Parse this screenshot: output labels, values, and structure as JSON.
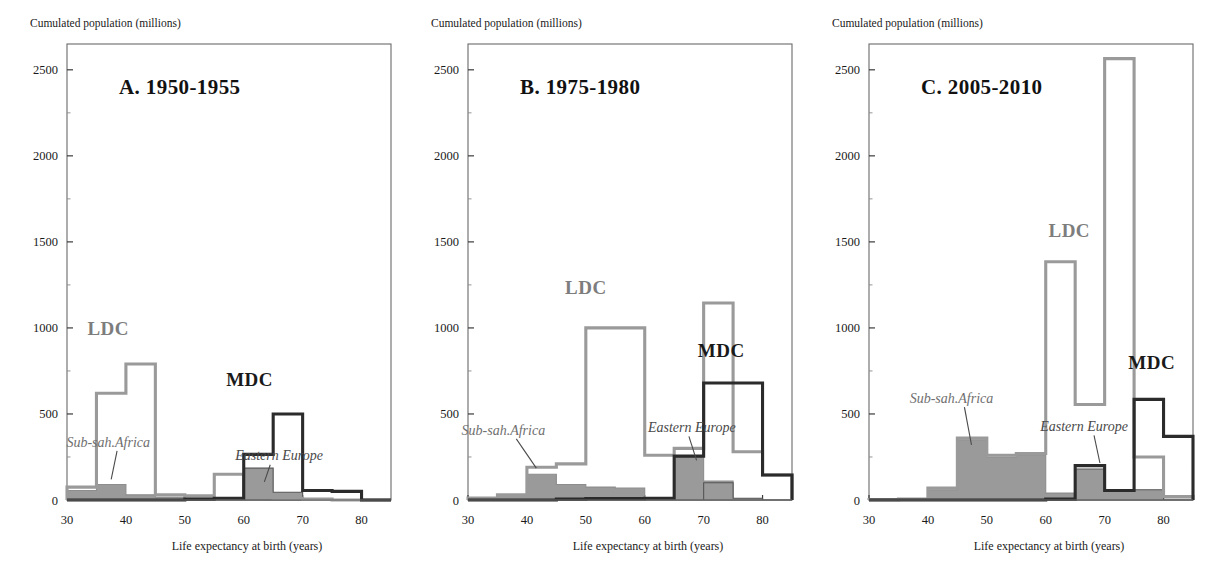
{
  "figure": {
    "background": "#ffffff",
    "colors": {
      "ldc_stroke": "#9a9a9a",
      "mdc_stroke": "#2b2b2b",
      "fill_grey": "#9a9a9a",
      "frame": "#6a6a6a",
      "text": "#1a1a1a"
    },
    "axis": {
      "ylabel": "Cumulated population (millions)",
      "xlabel": "Life expectancy at birth (years)",
      "yticks": [
        0,
        500,
        1000,
        1500,
        2000,
        2500
      ],
      "ytick_labels": [
        "0",
        "500",
        "1000",
        "1500",
        "2000",
        "2500"
      ],
      "xticks": [
        30,
        40,
        50,
        60,
        70,
        80
      ],
      "xtick_labels": [
        "30",
        "40",
        "50",
        "60",
        "70",
        "80"
      ],
      "ylim": [
        0,
        2650
      ],
      "xlim": [
        30,
        85
      ],
      "grid": false
    },
    "series_labels": {
      "ldc": "LDC",
      "mdc": "MDC",
      "sub_saharan_africa": "Sub-sah.Africa",
      "eastern_europe": "Eastern Europe"
    }
  },
  "chart_data": [
    {
      "id": "panel-a",
      "type": "bar",
      "title": "A. 1950-1955",
      "xlabel": "Life expectancy at birth (years)",
      "ylabel": "Cumulated population (millions)",
      "xlim": [
        30,
        85
      ],
      "ylim": [
        0,
        2650
      ],
      "bin_edges": [
        30,
        35,
        40,
        45,
        50,
        55,
        60,
        65,
        70,
        75,
        80,
        85
      ],
      "series": [
        {
          "name": "LDC",
          "style": "step-outline-grey",
          "values": [
            75,
            620,
            790,
            30,
            25,
            150,
            20,
            10,
            5,
            0,
            0
          ]
        },
        {
          "name": "MDC",
          "style": "step-outline-black",
          "values": [
            0,
            0,
            0,
            0,
            5,
            10,
            265,
            500,
            55,
            50,
            0
          ]
        },
        {
          "name": "Sub-sah.Africa",
          "style": "filled-grey",
          "values": [
            55,
            90,
            30,
            15,
            12,
            10,
            8,
            5,
            0,
            0,
            0
          ]
        },
        {
          "name": "Eastern Europe",
          "style": "filled-grey",
          "values": [
            0,
            0,
            0,
            0,
            0,
            0,
            185,
            45,
            0,
            0,
            0
          ]
        }
      ],
      "annotations": [
        {
          "text": "LDC",
          "x": 37,
          "y": 960
        },
        {
          "text": "MDC",
          "x": 61,
          "y": 660
        },
        {
          "text": "Sub-sah.Africa",
          "x": 37,
          "y": 310
        },
        {
          "text": "Eastern Europe",
          "x": 66,
          "y": 230
        }
      ]
    },
    {
      "id": "panel-b",
      "type": "bar",
      "title": "B. 1975-1980",
      "xlabel": "Life expectancy at birth (years)",
      "ylabel": "Cumulated population (millions)",
      "xlim": [
        30,
        85
      ],
      "ylim": [
        0,
        2650
      ],
      "bin_edges": [
        30,
        35,
        40,
        45,
        50,
        55,
        60,
        65,
        70,
        75,
        80,
        85
      ],
      "series": [
        {
          "name": "LDC",
          "style": "step-outline-grey",
          "values": [
            12,
            30,
            190,
            210,
            1000,
            1000,
            260,
            300,
            1145,
            280,
            145
          ]
        },
        {
          "name": "MDC",
          "style": "step-outline-black",
          "values": [
            0,
            0,
            0,
            5,
            8,
            8,
            10,
            255,
            680,
            680,
            145
          ]
        },
        {
          "name": "Sub-sah.Africa",
          "style": "filled-grey",
          "values": [
            10,
            30,
            150,
            90,
            75,
            70,
            10,
            250,
            110,
            5,
            0
          ]
        },
        {
          "name": "Eastern Europe",
          "style": "filled-grey",
          "values": [
            0,
            0,
            0,
            0,
            0,
            0,
            0,
            0,
            100,
            10,
            0
          ]
        }
      ],
      "annotations": [
        {
          "text": "LDC",
          "x": 50,
          "y": 1200
        },
        {
          "text": "MDC",
          "x": 73,
          "y": 830
        },
        {
          "text": "Sub-sah.Africa",
          "x": 36,
          "y": 380
        },
        {
          "text": "Eastern Europe",
          "x": 68,
          "y": 395
        }
      ]
    },
    {
      "id": "panel-c",
      "type": "bar",
      "title": "C. 2005-2010",
      "xlabel": "Life expectancy at birth (years)",
      "ylabel": "Cumulated population (millions)",
      "xlim": [
        30,
        85
      ],
      "ylim": [
        0,
        2650
      ],
      "bin_edges": [
        30,
        35,
        40,
        45,
        50,
        55,
        60,
        65,
        70,
        75,
        80,
        85
      ],
      "series": [
        {
          "name": "LDC",
          "style": "step-outline-grey",
          "values": [
            2,
            5,
            70,
            360,
            260,
            270,
            1385,
            555,
            2565,
            250,
            20
          ]
        },
        {
          "name": "MDC",
          "style": "step-outline-black",
          "values": [
            0,
            0,
            0,
            0,
            0,
            0,
            5,
            200,
            55,
            585,
            370
          ]
        },
        {
          "name": "Sub-sah.Africa",
          "style": "filled-grey",
          "values": [
            2,
            5,
            60,
            350,
            250,
            260,
            40,
            20,
            10,
            40,
            5
          ]
        },
        {
          "name": "Eastern Europe",
          "style": "filled-grey",
          "values": [
            0,
            0,
            0,
            0,
            0,
            0,
            0,
            180,
            50,
            60,
            0
          ]
        }
      ],
      "annotations": [
        {
          "text": "LDC",
          "x": 64,
          "y": 1530
        },
        {
          "text": "MDC",
          "x": 78,
          "y": 760
        },
        {
          "text": "Sub-sah.Africa",
          "x": 44,
          "y": 565
        },
        {
          "text": "Eastern Europe",
          "x": 66.5,
          "y": 400
        }
      ]
    }
  ]
}
